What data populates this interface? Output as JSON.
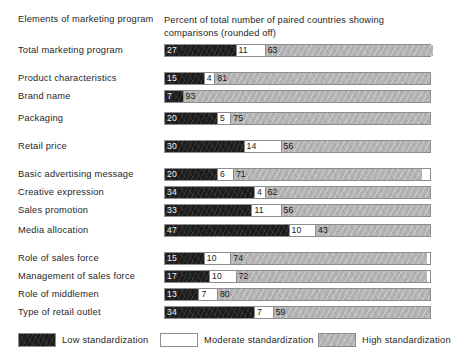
{
  "header": {
    "left_column_title": "Elements of marketing program",
    "right_column_title": "Percent of total number of paired countries showing comparisons (rounded off)"
  },
  "legend": {
    "low": {
      "label": "Low standardization",
      "color": "#1b1b1b",
      "icon": "legend-swatch-low"
    },
    "moderate": {
      "label": "Moderate standardization",
      "color": "#ffffff",
      "icon": "legend-swatch-moderate"
    },
    "high": {
      "label": "High standardization",
      "color": "#b3b3b3",
      "icon": "legend-swatch-high"
    }
  },
  "chart_data": {
    "type": "bar",
    "title": "",
    "subtitle": "",
    "orientation": "horizontal",
    "stacked": true,
    "stack_total": 100,
    "xlabel": "Percent of total number of paired countries showing comparisons (rounded off)",
    "ylabel": "Elements of marketing program",
    "xlim": [
      0,
      100
    ],
    "grid": false,
    "legend_position": "bottom",
    "categories": [
      "Total marketing program",
      "Product characteristics",
      "Brand name",
      "Packaging",
      "Retail price",
      "Basic advertising message",
      "Creative expression",
      "Sales promotion",
      "Media allocation",
      "Role of sales force",
      "Management of sales force",
      "Role of middlemen",
      "Type of retail outlet"
    ],
    "series": [
      {
        "name": "Low standardization",
        "color": "#1b1b1b",
        "values": [
          27,
          15,
          7,
          20,
          30,
          20,
          34,
          33,
          47,
          15,
          17,
          13,
          34
        ]
      },
      {
        "name": "Moderate standardization",
        "color": "#ffffff",
        "values": [
          11,
          4,
          0,
          5,
          14,
          6,
          4,
          11,
          10,
          10,
          10,
          7,
          7
        ]
      },
      {
        "name": "High standardization",
        "color": "#b3b3b3",
        "values": [
          63,
          81,
          93,
          75,
          56,
          71,
          62,
          56,
          43,
          74,
          72,
          80,
          59
        ]
      }
    ],
    "value_labels": {
      "Total marketing program": {
        "low": "27",
        "moderate": "11",
        "high": "63"
      },
      "Product characteristics": {
        "low": "15",
        "moderate": "4",
        "high": "81"
      },
      "Brand name": {
        "low": "7",
        "moderate": "",
        "high": "93"
      },
      "Packaging": {
        "low": "20",
        "moderate": "5",
        "high": "75"
      },
      "Retail price": {
        "low": "30",
        "moderate": "14",
        "high": "56"
      },
      "Basic advertising message": {
        "low": "20",
        "moderate": "6",
        "high": "71"
      },
      "Creative expression": {
        "low": "34",
        "moderate": "4",
        "high": "62"
      },
      "Sales promotion": {
        "low": "33",
        "moderate": "11",
        "high": "56"
      },
      "Media allocation": {
        "low": "47",
        "moderate": "10",
        "high": "43"
      },
      "Role of sales force": {
        "low": "15",
        "moderate": "10",
        "high": "74"
      },
      "Management of sales force": {
        "low": "17",
        "moderate": "10",
        "high": "72"
      },
      "Role of middlemen": {
        "low": "13",
        "moderate": "7",
        "high": "80"
      },
      "Type of retail outlet": {
        "low": "34",
        "moderate": "7",
        "high": "59"
      }
    },
    "row_layout_top_px": [
      44,
      72,
      90,
      112,
      140,
      168,
      186,
      204,
      224,
      252,
      270,
      288,
      306
    ]
  }
}
